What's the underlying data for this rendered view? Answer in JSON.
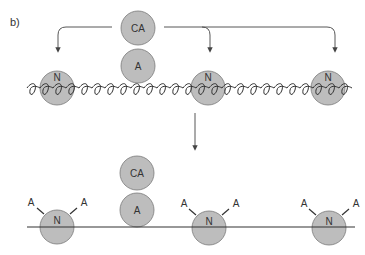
{
  "panel_label": "b)",
  "colors": {
    "circle_fill": "#bdbdbd",
    "circle_stroke": "#7a7a7a",
    "line": "#444444",
    "text": "#333333"
  },
  "top": {
    "complex": {
      "upper": "CA",
      "lower": "A"
    },
    "nucleosomes": [
      {
        "label": "N"
      },
      {
        "label": "N"
      },
      {
        "label": "N"
      }
    ]
  },
  "bottom": {
    "complex": {
      "upper": "CA",
      "lower": "A"
    },
    "nucleosomes": [
      {
        "label": "N",
        "left_tag": "A",
        "right_tag": "A"
      },
      {
        "label": "N",
        "left_tag": "A",
        "right_tag": "A"
      },
      {
        "label": "N",
        "left_tag": "A",
        "right_tag": "A"
      }
    ]
  }
}
